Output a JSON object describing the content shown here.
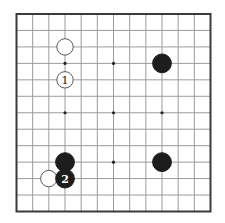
{
  "board": {
    "size": 13,
    "geometry": {
      "left": 16.5,
      "top": 14,
      "right": 210.5,
      "bottom": 211.5
    },
    "colors": {
      "background": "#ffffff",
      "grid_line": "#9b9b9b",
      "border": "#3a3a3a",
      "black_stone": "#1d1d1d",
      "white_stone": "#ffffff",
      "white_stone_outline": "#5a5a5a",
      "star_point": "#222222",
      "label_on_white": "#111111",
      "label_on_black": "#ffffff"
    },
    "star_points": [
      [
        4,
        4
      ],
      [
        7,
        4
      ],
      [
        10,
        4
      ],
      [
        4,
        7
      ],
      [
        7,
        7
      ],
      [
        10,
        7
      ],
      [
        4,
        10
      ],
      [
        7,
        10
      ],
      [
        10,
        10
      ]
    ],
    "stones": [
      {
        "col": 4,
        "row": 3,
        "color": "white",
        "label": ""
      },
      {
        "col": 4,
        "row": 5,
        "color": "white",
        "label": "1"
      },
      {
        "col": 10,
        "row": 4,
        "color": "black",
        "label": ""
      },
      {
        "col": 4,
        "row": 10,
        "color": "black",
        "label": ""
      },
      {
        "col": 10,
        "row": 10,
        "color": "black",
        "label": ""
      },
      {
        "col": 3,
        "row": 11,
        "color": "white",
        "label": ""
      },
      {
        "col": 4,
        "row": 11,
        "color": "black",
        "label": "2"
      }
    ],
    "stone_radius": {
      "black": 9.4,
      "white": 8.2
    },
    "star_radius": 1.6,
    "label_font_size": 11
  }
}
